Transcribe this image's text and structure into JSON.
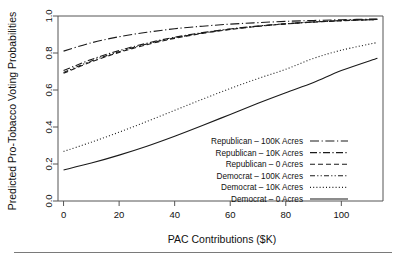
{
  "chart_data": {
    "type": "line",
    "title": "",
    "xlabel": "PAC Contributions ($K)",
    "ylabel": "Predicted Pro-Tobacco Voting Probabilities",
    "xlim": [
      -2,
      115
    ],
    "ylim": [
      0.0,
      1.0
    ],
    "xticks": [
      0,
      20,
      40,
      60,
      80,
      100
    ],
    "yticks": [
      "0.0",
      "0.2",
      "0.4",
      "0.6",
      "0.8",
      "1.0"
    ],
    "ytick_values": [
      0.0,
      0.2,
      0.4,
      0.6,
      0.8,
      1.0
    ],
    "grid": false,
    "legend_position": "lower-right",
    "x": [
      0,
      10,
      20,
      30,
      40,
      50,
      60,
      70,
      80,
      90,
      100,
      113
    ],
    "series": [
      {
        "name": "Republican – 100K Acres",
        "dash": "dashdot-long",
        "values": [
          0.81,
          0.855,
          0.888,
          0.912,
          0.931,
          0.945,
          0.956,
          0.964,
          0.971,
          0.976,
          0.98,
          0.984
        ]
      },
      {
        "name": "Republican – 10K Acres",
        "dash": "dashdot",
        "values": [
          0.705,
          0.765,
          0.813,
          0.853,
          0.885,
          0.91,
          0.93,
          0.946,
          0.958,
          0.968,
          0.975,
          0.982
        ]
      },
      {
        "name": "Republican – 0 Acres",
        "dash": "dashed-short",
        "values": [
          0.69,
          0.752,
          0.803,
          0.845,
          0.879,
          0.906,
          0.927,
          0.944,
          0.957,
          0.967,
          0.974,
          0.981
        ]
      },
      {
        "name": "Democrat – 100K Acres",
        "dash": "dash-dot-dot",
        "values": [
          0.695,
          0.757,
          0.807,
          0.849,
          0.882,
          0.908,
          0.929,
          0.945,
          0.958,
          0.968,
          0.975,
          0.981
        ]
      },
      {
        "name": "Democrat – 10K Acres",
        "dash": "dotted",
        "values": [
          0.268,
          0.318,
          0.372,
          0.43,
          0.49,
          0.55,
          0.608,
          0.662,
          0.712,
          0.771,
          0.815,
          0.857
        ]
      },
      {
        "name": "Democrat – 0 Acres",
        "dash": "solid",
        "values": [
          0.168,
          0.205,
          0.248,
          0.296,
          0.35,
          0.408,
          0.468,
          0.528,
          0.585,
          0.64,
          0.705,
          0.772
        ]
      }
    ],
    "legend": [
      {
        "label": "Republican – 100K Acres",
        "dash": "dashdot-long"
      },
      {
        "label": "Republican – 10K Acres",
        "dash": "dashdot"
      },
      {
        "label": "Republican – 0 Acres",
        "dash": "dashed-short"
      },
      {
        "label": "Democrat – 100K Acres",
        "dash": "dash-dot-dot"
      },
      {
        "label": "Democrat – 10K Acres",
        "dash": "dotted"
      },
      {
        "label": "Democrat – 0 Acres",
        "dash": "solid"
      }
    ],
    "colors": {
      "line": "#1a1a1a",
      "frame": "#555555",
      "text": "#111111",
      "background": "#ffffff"
    }
  }
}
